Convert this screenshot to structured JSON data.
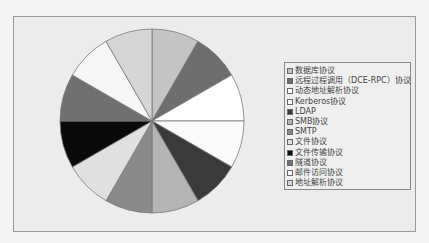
{
  "chart_data": {
    "type": "pie",
    "title": "",
    "legend_position": "right",
    "categories": [
      "数据库协议",
      "远程过程调用（DCE-RPC）协议",
      "动态地址解析协议",
      "Kerberos协议",
      "LDAP",
      "SMB协议",
      "SMTP",
      "文件协议",
      "文件传输协议",
      "隧道协议",
      "邮件访问协议",
      "地址解析协议"
    ],
    "values": [
      1,
      1,
      1,
      1,
      1,
      1,
      1,
      1,
      1,
      1,
      1,
      1
    ],
    "colors": [
      "#c4c4c4",
      "#6e6e6e",
      "#ffffff",
      "#fafafa",
      "#3a3a3a",
      "#b4b4b4",
      "#8a8a8a",
      "#e0e0e0",
      "#0a0a0a",
      "#707070",
      "#f6f6f6",
      "#d6d6d6"
    ]
  },
  "legend": {
    "items": [
      {
        "label": "数据库协议"
      },
      {
        "label": "远程过程调用（DCE-RPC）协议"
      },
      {
        "label": "动态地址解析协议"
      },
      {
        "label": "Kerberos协议"
      },
      {
        "label": "LDAP"
      },
      {
        "label": "SMB协议"
      },
      {
        "label": "SMTP"
      },
      {
        "label": "文件协议"
      },
      {
        "label": "文件传输协议"
      },
      {
        "label": "隧道协议"
      },
      {
        "label": "邮件访问协议"
      },
      {
        "label": "地址解析协议"
      }
    ]
  }
}
